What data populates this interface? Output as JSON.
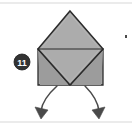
{
  "figure": {
    "kind": "origami-fold-step-diagram",
    "canvas": {
      "width": 132,
      "height": 130
    },
    "colors": {
      "paper_fill": "#a8a8a8",
      "paper_fill_light": "#b4b4b4",
      "paper_fill_shadow": "#9c9c9c",
      "outline": "#2b2b2b",
      "fold_line": "#3a3a3a",
      "arrow": "#4a4a4a",
      "badge_fill": "#333333",
      "badge_text": "#ffffff",
      "frame_rule": "#d8d8d8",
      "background": "#ffffff",
      "speck": "#4a4a4a"
    }
  },
  "step_badge": {
    "label": "11",
    "center_x": 22,
    "center_y": 62,
    "radius": 8
  },
  "shapes": {
    "diamond_top": {
      "name": "upper-square-flap",
      "points": "70,11 103,49 70,85 38,49",
      "apex": [
        70,
        11
      ],
      "left": [
        38,
        49
      ],
      "right": [
        103,
        49
      ],
      "bottom": [
        70,
        85
      ]
    },
    "body_rect": {
      "name": "lower-rectangular-body",
      "points": "38,49 103,49 103,85 38,85",
      "top_y": 49,
      "bottom_y": 85,
      "left_x": 38,
      "right_x": 103
    },
    "fold_left": {
      "name": "left-diagonal-fold",
      "from": [
        38,
        49
      ],
      "to": [
        70,
        85
      ]
    },
    "fold_right": {
      "name": "right-diagonal-fold",
      "from": [
        103,
        49
      ],
      "to": [
        70,
        85
      ]
    }
  },
  "arrows": [
    {
      "name": "left-flap-swing-arrow",
      "direction": "down-left",
      "path": "M 57,86 C 47,96 42,104 41,112",
      "head": "36,108 49,111 42,120"
    },
    {
      "name": "right-flap-swing-arrow",
      "direction": "down-right",
      "path": "M 85,86 C 94,96 98,104 99,112",
      "head": "104,108 91,111 98,120"
    }
  ],
  "frame": {
    "top_rule": {
      "name": "top-border-rule",
      "y": 3,
      "x1": 0,
      "x2": 132
    },
    "bottom_rule": {
      "name": "bottom-border-rule",
      "y": 122,
      "x1": 0,
      "x2": 132
    }
  },
  "speck": {
    "name": "scan-speck",
    "x": 125,
    "y": 35,
    "width": 2,
    "height": 3
  }
}
